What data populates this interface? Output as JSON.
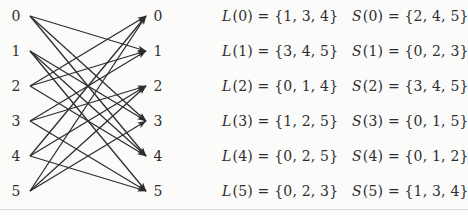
{
  "colors": {
    "ink": "#2e2e2e",
    "background": "#fbfbfa",
    "bottom_rule": "#d9d9d9"
  },
  "graph": {
    "left_labels": [
      "0",
      "1",
      "2",
      "3",
      "4",
      "5"
    ],
    "right_labels": [
      "0",
      "1",
      "2",
      "3",
      "4",
      "5"
    ],
    "edges": [
      [
        0,
        1
      ],
      [
        0,
        3
      ],
      [
        0,
        4
      ],
      [
        1,
        3
      ],
      [
        1,
        4
      ],
      [
        1,
        5
      ],
      [
        2,
        0
      ],
      [
        2,
        1
      ],
      [
        2,
        4
      ],
      [
        3,
        1
      ],
      [
        3,
        2
      ],
      [
        3,
        5
      ],
      [
        4,
        0
      ],
      [
        4,
        2
      ],
      [
        4,
        5
      ],
      [
        5,
        0
      ],
      [
        5,
        2
      ],
      [
        5,
        3
      ]
    ]
  },
  "equations": {
    "L": [
      {
        "func": "L",
        "rest": "(0) = {1, 3, 4}"
      },
      {
        "func": "L",
        "rest": "(1) = {3, 4, 5}"
      },
      {
        "func": "L",
        "rest": "(2) = {0, 1, 4}"
      },
      {
        "func": "L",
        "rest": "(3) = {1, 2, 5}"
      },
      {
        "func": "L",
        "rest": "(4) = {0, 2, 5}"
      },
      {
        "func": "L",
        "rest": "(5) = {0, 2, 3}"
      }
    ],
    "S": [
      {
        "func": "S",
        "rest": "(0) = {2, 4, 5}"
      },
      {
        "func": "S",
        "rest": "(1) = {0, 2, 3}"
      },
      {
        "func": "S",
        "rest": "(2) = {3, 4, 5}"
      },
      {
        "func": "S",
        "rest": "(3) = {0, 1, 5}"
      },
      {
        "func": "S",
        "rest": "(4) = {0, 1, 2}"
      },
      {
        "func": "S",
        "rest": "(5) = {1, 3, 4}"
      }
    ]
  }
}
